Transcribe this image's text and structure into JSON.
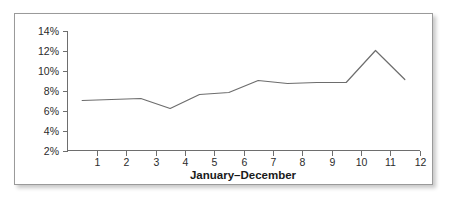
{
  "chart_data": {
    "type": "line",
    "title": "",
    "xlabel": "January–December",
    "ylabel": "",
    "x": [
      0.5,
      1.5,
      2.5,
      3.5,
      4.5,
      5.5,
      6.5,
      7.5,
      8.5,
      9.5,
      10.5,
      11.5
    ],
    "values": [
      7.0,
      7.1,
      7.2,
      6.2,
      7.6,
      7.8,
      9.0,
      8.7,
      8.8,
      8.8,
      12.0,
      9.1
    ],
    "series": [
      {
        "name": "",
        "values": [
          7.0,
          7.1,
          7.2,
          6.2,
          7.6,
          7.8,
          9.0,
          8.7,
          8.8,
          8.8,
          12.0,
          9.1
        ]
      }
    ],
    "x_tick_labels": [
      "1",
      "2",
      "3",
      "4",
      "5",
      "6",
      "7",
      "8",
      "9",
      "10",
      "11",
      "12"
    ],
    "x_tick_values": [
      1,
      2,
      3,
      4,
      5,
      6,
      7,
      8,
      9,
      10,
      11,
      12
    ],
    "y_tick_labels": [
      "2%",
      "4%",
      "6%",
      "8%",
      "10%",
      "12%",
      "14%"
    ],
    "y_tick_values": [
      2,
      4,
      6,
      8,
      10,
      12,
      14
    ],
    "xlim": [
      0,
      12
    ],
    "ylim": [
      2,
      14
    ],
    "grid": false,
    "legend": "none",
    "line_color": "#6d6d6d",
    "axis_color": "#6e6e6e",
    "text_color": "#2b2b2b",
    "background": "#ffffff",
    "border_color": "#9a9a9a"
  },
  "figure": {
    "caption": ""
  }
}
